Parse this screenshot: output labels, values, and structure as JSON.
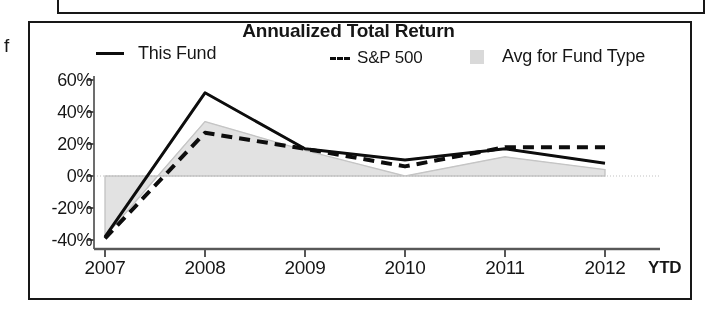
{
  "page": {
    "margin_letter": "f"
  },
  "chart_data": {
    "type": "line",
    "title": "Annualized Total Return",
    "xlabel": "",
    "ylabel": "",
    "categories": [
      "2007",
      "2008",
      "2009",
      "2010",
      "2011",
      "2012 YTD"
    ],
    "x_tick_labels": [
      "2007",
      "2008",
      "2009",
      "2010",
      "2011",
      "2012"
    ],
    "x_last_suffix": "YTD",
    "y_tick_labels": [
      "60%",
      "40%",
      "20%",
      "0%",
      "-20%",
      "-40%"
    ],
    "y_tick_values": [
      60,
      40,
      20,
      0,
      -20,
      -40
    ],
    "ylim": [
      -48,
      62
    ],
    "grid": false,
    "legend_position": "top",
    "series": [
      {
        "name": "This Fund",
        "style": "solid",
        "color": "#111111",
        "values": [
          -38,
          52,
          17,
          10,
          17,
          8
        ]
      },
      {
        "name": "S&P 500",
        "style": "dashed",
        "color": "#111111",
        "values": [
          -39,
          27,
          17,
          6,
          18,
          18
        ]
      },
      {
        "name": "Avg for Fund Type",
        "style": "area",
        "color": "#d2d2d2",
        "values": [
          -38,
          34,
          16,
          0,
          12,
          4
        ]
      }
    ]
  },
  "legend": {
    "items": [
      {
        "label": "This Fund",
        "marker": "solid-line-swatch"
      },
      {
        "label": "S&P 500",
        "marker": "dashed-line-swatch"
      },
      {
        "label": "Avg for Fund Type",
        "marker": "gray-area-swatch"
      }
    ]
  },
  "colors": {
    "line": "#111111",
    "area_fill": "#d8d8d8",
    "area_edge": "#c2c2c2",
    "frame": "#1c1c1c",
    "text": "#1a1a1a"
  }
}
